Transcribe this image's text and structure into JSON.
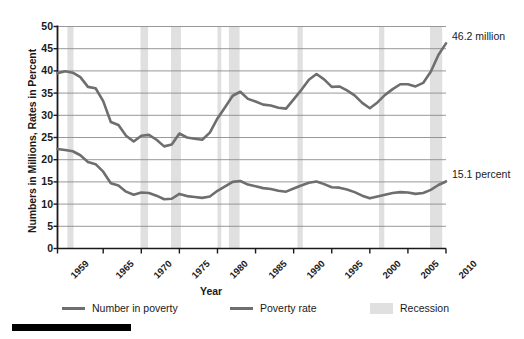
{
  "chart_data": {
    "type": "line",
    "title": "",
    "xlabel": "Year",
    "ylabel": "Numbers in Millions, Rates in Percent",
    "xlim": [
      1959,
      2010
    ],
    "ylim": [
      0,
      50
    ],
    "ytick_step": 5,
    "grid": true,
    "legend_position": "bottom",
    "yticks": [
      "0",
      "5",
      "10",
      "15",
      "20",
      "25",
      "30",
      "35",
      "40",
      "45",
      "50"
    ],
    "xticks": [
      "1959",
      "1965",
      "1970",
      "1975",
      "1980",
      "1985",
      "1990",
      "1995",
      "2000",
      "2005",
      "2010"
    ],
    "x": [
      1959,
      1960,
      1961,
      1962,
      1963,
      1964,
      1965,
      1966,
      1967,
      1968,
      1969,
      1970,
      1971,
      1972,
      1973,
      1974,
      1975,
      1976,
      1977,
      1978,
      1979,
      1980,
      1981,
      1982,
      1983,
      1984,
      1985,
      1986,
      1987,
      1988,
      1989,
      1990,
      1991,
      1992,
      1993,
      1994,
      1995,
      1996,
      1997,
      1998,
      1999,
      2000,
      2001,
      2002,
      2003,
      2004,
      2005,
      2006,
      2007,
      2008,
      2009,
      2010
    ],
    "series": [
      {
        "name": "Number in poverty",
        "unit": "millions",
        "color": "#6e6e6e",
        "values": [
          39.5,
          39.9,
          39.6,
          38.6,
          36.4,
          36.1,
          33.2,
          28.5,
          27.8,
          25.4,
          24.1,
          25.4,
          25.6,
          24.5,
          23.0,
          23.4,
          25.9,
          25.0,
          24.7,
          24.5,
          26.1,
          29.3,
          31.8,
          34.4,
          35.3,
          33.7,
          33.1,
          32.4,
          32.2,
          31.7,
          31.5,
          33.6,
          35.7,
          38.0,
          39.3,
          38.1,
          36.4,
          36.5,
          35.6,
          34.5,
          32.8,
          31.6,
          32.9,
          34.6,
          35.9,
          37.0,
          37.0,
          36.5,
          37.3,
          39.8,
          43.6,
          46.2
        ]
      },
      {
        "name": "Poverty rate",
        "unit": "percent",
        "color": "#6e6e6e",
        "values": [
          22.4,
          22.2,
          21.9,
          21.0,
          19.5,
          19.0,
          17.3,
          14.7,
          14.2,
          12.8,
          12.1,
          12.6,
          12.5,
          11.9,
          11.1,
          11.2,
          12.3,
          11.8,
          11.6,
          11.4,
          11.7,
          13.0,
          14.0,
          15.0,
          15.2,
          14.4,
          14.0,
          13.6,
          13.4,
          13.0,
          12.8,
          13.5,
          14.2,
          14.8,
          15.1,
          14.5,
          13.8,
          13.7,
          13.3,
          12.7,
          11.9,
          11.3,
          11.7,
          12.1,
          12.5,
          12.7,
          12.6,
          12.3,
          12.5,
          13.2,
          14.3,
          15.1
        ]
      }
    ],
    "recessions": [
      {
        "start": 1960.3,
        "end": 1961.1
      },
      {
        "start": 1969.9,
        "end": 1970.9
      },
      {
        "start": 1973.9,
        "end": 1975.2
      },
      {
        "start": 1980.0,
        "end": 1980.5
      },
      {
        "start": 1981.5,
        "end": 1982.9
      },
      {
        "start": 1990.5,
        "end": 1991.2
      },
      {
        "start": 2001.2,
        "end": 2001.9
      },
      {
        "start": 2007.9,
        "end": 2009.5
      }
    ],
    "recession_color": "#e0e0e0",
    "annotations": [
      {
        "name": "number-in-poverty-end-label",
        "text": "46.2 million",
        "x": 2010,
        "y": 46.2
      },
      {
        "name": "poverty-rate-end-label",
        "text": "15.1 percent",
        "x": 2010,
        "y": 15.1
      }
    ]
  },
  "legend": {
    "items": [
      {
        "label": "Number in poverty",
        "type": "line",
        "color": "#6e6e6e"
      },
      {
        "label": "Poverty rate",
        "type": "line",
        "color": "#6e6e6e"
      },
      {
        "label": "Recession",
        "type": "box",
        "color": "#e0e0e0"
      }
    ]
  },
  "axes": {
    "x_title": "Year",
    "y_title": "Numbers in Millions, Rates in Percent"
  }
}
